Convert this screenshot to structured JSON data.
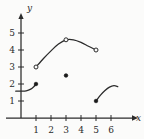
{
  "chart_data": {
    "type": "line",
    "title": "",
    "subtitle": "",
    "xlabel": "x",
    "ylabel": "y",
    "xlim": [
      0,
      6.8
    ],
    "ylim": [
      0,
      5.9
    ],
    "grid": false,
    "legend": null,
    "xticks": [
      1,
      2,
      3,
      4,
      5,
      6
    ],
    "xtick_labels": [
      "1",
      "2",
      "3",
      "4",
      "5",
      "6"
    ],
    "yticks": [
      1,
      2,
      3,
      4,
      5
    ],
    "ytick_labels": [
      "1",
      "2",
      "3",
      "4",
      "5"
    ],
    "axis_arrows": [
      "x",
      "y"
    ],
    "series": [
      {
        "name": "branch-1",
        "comment": "rising branch from left of y-axis up to closed endpoint at (1,2)",
        "x": [
          -0.35,
          0.0,
          0.35,
          0.65,
          0.85,
          1.0
        ],
        "y": [
          1.58,
          1.58,
          1.6,
          1.7,
          1.84,
          2.0
        ],
        "endpoints": [
          {
            "x": 1,
            "y": 2,
            "type": "closed"
          }
        ]
      },
      {
        "name": "branch-2",
        "comment": "concave-down arc from open endpoint (1,3) through peak near (3,4.6) to open endpoint (5,4)",
        "x": [
          1.0,
          1.5,
          2.0,
          2.5,
          3.0,
          3.5,
          4.0,
          4.5,
          5.0
        ],
        "y": [
          3.0,
          3.5,
          3.95,
          4.35,
          4.6,
          4.6,
          4.45,
          4.22,
          4.0
        ],
        "endpoints": [
          {
            "x": 1,
            "y": 3,
            "type": "open"
          },
          {
            "x": 3,
            "y": 4.6,
            "type": "open"
          },
          {
            "x": 5,
            "y": 4,
            "type": "open"
          }
        ]
      },
      {
        "name": "branch-3",
        "comment": "small arc rising from closed endpoint (5,1) to about (6.4,1.85)",
        "x": [
          5.0,
          5.3,
          5.6,
          5.9,
          6.2,
          6.45
        ],
        "y": [
          1.0,
          1.35,
          1.62,
          1.82,
          1.9,
          1.85
        ],
        "endpoints": [
          {
            "x": 5,
            "y": 1,
            "type": "closed"
          }
        ]
      }
    ],
    "isolated_points": [
      {
        "x": 3,
        "y": 2.5,
        "type": "closed"
      }
    ]
  },
  "figure": {
    "axis_label_x": "x",
    "axis_label_y": "y",
    "background_color": "#fbfbfa",
    "ink_color": "#2b2b2b"
  }
}
